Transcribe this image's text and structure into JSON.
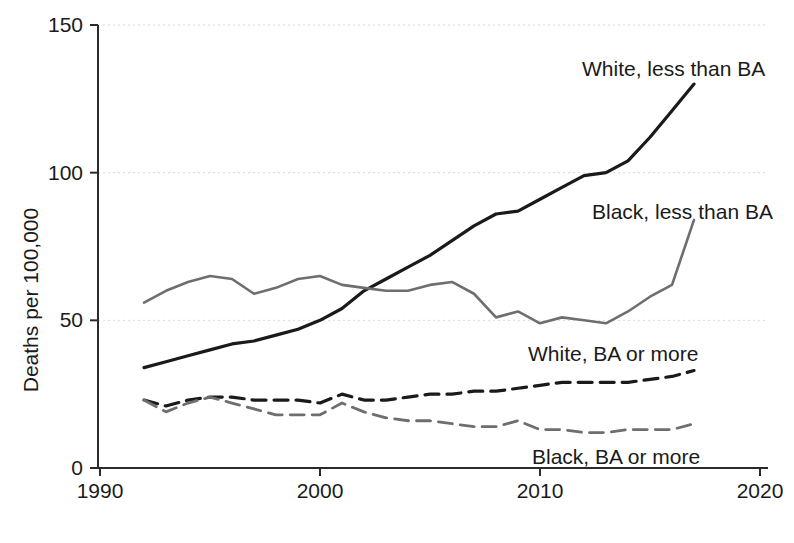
{
  "chart_data": {
    "type": "line",
    "title": "",
    "subtitle": "",
    "xlabel": "",
    "ylabel": "Deaths per 100,000",
    "xlim": [
      1990,
      2020
    ],
    "ylim": [
      0,
      150
    ],
    "xticks": [
      1990,
      2000,
      2010,
      2020
    ],
    "xtick_labels": [
      "1990",
      "2000",
      "2010",
      "2020"
    ],
    "yticks": [
      0,
      50,
      100,
      150
    ],
    "ytick_labels": [
      "0",
      "50",
      "100",
      "150"
    ],
    "grid": true,
    "legend_position": "inline-annotations",
    "x": [
      1992,
      1993,
      1994,
      1995,
      1996,
      1997,
      1998,
      1999,
      2000,
      2001,
      2002,
      2003,
      2004,
      2005,
      2006,
      2007,
      2008,
      2009,
      2010,
      2011,
      2012,
      2013,
      2014,
      2015,
      2016,
      2017
    ],
    "series": [
      {
        "name": "White, less than BA",
        "color": "#1a1a1a",
        "style": "solid",
        "width": 3.2,
        "label_x": 582,
        "label_y": 76,
        "values": [
          34,
          36,
          38,
          40,
          42,
          43,
          45,
          47,
          50,
          54,
          60,
          64,
          68,
          72,
          77,
          82,
          86,
          87,
          91,
          95,
          99,
          100,
          104,
          112,
          121,
          130
        ]
      },
      {
        "name": "Black, less than BA",
        "color": "#6e6e6e",
        "style": "solid",
        "width": 2.6,
        "label_x": 592,
        "label_y": 219,
        "values": [
          56,
          60,
          63,
          65,
          64,
          59,
          61,
          64,
          65,
          62,
          61,
          60,
          60,
          62,
          63,
          59,
          51,
          53,
          49,
          51,
          50,
          49,
          53,
          58,
          62,
          84
        ]
      },
      {
        "name": "White, BA or more",
        "color": "#1a1a1a",
        "style": "dashed",
        "width": 3.2,
        "label_x": 528,
        "label_y": 361,
        "values": [
          23,
          21,
          23,
          24,
          24,
          23,
          23,
          23,
          22,
          25,
          23,
          23,
          24,
          25,
          25,
          26,
          26,
          27,
          28,
          29,
          29,
          29,
          29,
          30,
          31,
          33
        ]
      },
      {
        "name": "Black, BA or more",
        "color": "#6e6e6e",
        "style": "dashed",
        "width": 2.8,
        "label_x": 532,
        "label_y": 464,
        "values": [
          23,
          19,
          22,
          24,
          22,
          20,
          18,
          18,
          18,
          22,
          19,
          17,
          16,
          16,
          15,
          14,
          14,
          16,
          13,
          13,
          12,
          12,
          13,
          13,
          13,
          15
        ]
      }
    ]
  },
  "plot_geometry": {
    "x_axis_y": 468,
    "y_axis_x": 98,
    "x_left_px": 100,
    "x_right_px": 760,
    "y_zero_px": 468,
    "y_top_px": 25,
    "tick_len": 8
  }
}
